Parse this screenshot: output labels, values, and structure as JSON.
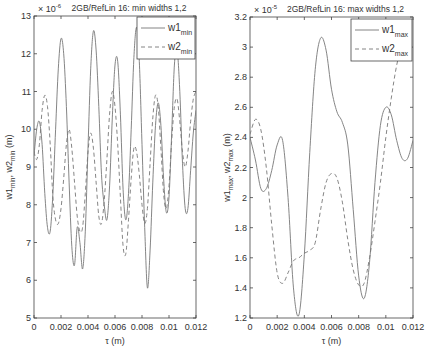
{
  "chart_data": [
    {
      "type": "line",
      "title": "2GB/RefLin 16: min widths 1,2",
      "scale_label": "× 10⁻⁶",
      "xlabel": "τ (m)",
      "ylabel": "w1_min, w2_min (m)",
      "xlim": [
        0,
        0.012
      ],
      "ylim": [
        5,
        13
      ],
      "xticks": [
        "0",
        "0.002",
        "0.004",
        "0.006",
        "0.008",
        "0.01",
        "0.012"
      ],
      "yticks": [
        "5",
        "6",
        "7",
        "8",
        "9",
        "10",
        "11",
        "12",
        "13"
      ],
      "grid": false,
      "legend_position": "top-right",
      "series": [
        {
          "name": "w1_min",
          "style": "solid",
          "x": [
            0,
            0.0002,
            0.0004,
            0.0006,
            0.0008,
            0.001,
            0.0012,
            0.0014,
            0.0016,
            0.0018,
            0.002,
            0.0022,
            0.0024,
            0.0026,
            0.0028,
            0.003,
            0.0032,
            0.0034,
            0.0036,
            0.0038,
            0.004,
            0.0042,
            0.0044,
            0.0046,
            0.0048,
            0.005,
            0.0052,
            0.0054,
            0.0056,
            0.0058,
            0.006,
            0.0062,
            0.0064,
            0.0066,
            0.0068,
            0.007,
            0.0072,
            0.0074,
            0.0076,
            0.0078,
            0.008,
            0.0082,
            0.0084,
            0.0086,
            0.0088,
            0.009,
            0.0092,
            0.0094,
            0.0096,
            0.0098,
            0.01,
            0.0102,
            0.0104,
            0.0106,
            0.0108,
            0.011,
            0.0112,
            0.0114,
            0.0116,
            0.0118,
            0.012
          ],
          "values": [
            9.3,
            10.0,
            10.2,
            9.6,
            8.3,
            7.4,
            7.3,
            8.3,
            10.0,
            11.6,
            12.4,
            12.0,
            10.6,
            8.6,
            6.9,
            6.4,
            7.4,
            7.0,
            6.3,
            7.3,
            9.5,
            11.6,
            12.6,
            12.1,
            10.6,
            8.8,
            8.0,
            7.6,
            8.5,
            10.3,
            11.7,
            11.8,
            10.4,
            8.4,
            7.6,
            8.3,
            10.0,
            11.9,
            12.7,
            11.8,
            9.6,
            7.4,
            5.8,
            6.8,
            8.6,
            10.1,
            10.7,
            10.1,
            8.7,
            7.8,
            8.2,
            9.9,
            11.7,
            12.1,
            11.0,
            9.1,
            7.9,
            7.9,
            8.9,
            9.9,
            10.5
          ]
        },
        {
          "name": "w2_min",
          "style": "dashed",
          "x": [
            0,
            0.0002,
            0.0004,
            0.0006,
            0.0008,
            0.001,
            0.0012,
            0.0014,
            0.0016,
            0.0018,
            0.002,
            0.0022,
            0.0024,
            0.0026,
            0.0028,
            0.003,
            0.0032,
            0.0034,
            0.0036,
            0.0038,
            0.004,
            0.0042,
            0.0044,
            0.0046,
            0.0048,
            0.005,
            0.0052,
            0.0054,
            0.0056,
            0.0058,
            0.006,
            0.0062,
            0.0064,
            0.0066,
            0.0068,
            0.007,
            0.0072,
            0.0074,
            0.0076,
            0.0078,
            0.008,
            0.0082,
            0.0084,
            0.0086,
            0.0088,
            0.009,
            0.0092,
            0.0094,
            0.0096,
            0.0098,
            0.01,
            0.0102,
            0.0104,
            0.0106,
            0.0108,
            0.011,
            0.0112,
            0.0114,
            0.0116,
            0.0118,
            0.012
          ],
          "values": [
            9.4,
            9.2,
            9.6,
            10.5,
            10.9,
            10.6,
            9.6,
            8.2,
            7.6,
            7.5,
            7.9,
            8.7,
            9.6,
            10.0,
            9.5,
            8.6,
            7.7,
            7.3,
            7.4,
            8.3,
            9.4,
            9.9,
            9.5,
            8.6,
            7.7,
            7.5,
            8.1,
            9.2,
            10.4,
            11.0,
            10.6,
            9.6,
            8.2,
            6.9,
            6.7,
            7.6,
            8.7,
            9.5,
            9.4,
            8.8,
            8.0,
            7.5,
            7.9,
            9.1,
            10.3,
            10.9,
            10.6,
            9.5,
            8.3,
            7.9,
            8.5,
            9.7,
            10.6,
            10.8,
            10.2,
            9.4,
            9.0,
            9.4,
            10.2,
            10.8,
            11.0
          ]
        }
      ]
    },
    {
      "type": "line",
      "title": "2GB/RefLin 16: max widths 1,2",
      "scale_label": "× 10⁻⁵",
      "xlabel": "τ (m)",
      "ylabel": "w1_max, w2_max (m)",
      "xlim": [
        0,
        0.012
      ],
      "ylim": [
        1.2,
        3.2
      ],
      "xticks": [
        "0",
        "0.002",
        "0.004",
        "0.006",
        "0.008",
        "0.01",
        "0.012"
      ],
      "yticks": [
        "1.2",
        "1.4",
        "1.6",
        "1.8",
        "2",
        "2.2",
        "2.4",
        "2.6",
        "2.8",
        "3",
        "3.2"
      ],
      "grid": false,
      "legend_position": "top-right",
      "series": [
        {
          "name": "w1_max",
          "style": "solid",
          "x": [
            0,
            0.0004,
            0.0008,
            0.0012,
            0.0016,
            0.002,
            0.0024,
            0.0028,
            0.0032,
            0.0036,
            0.004,
            0.0044,
            0.0048,
            0.0052,
            0.0056,
            0.006,
            0.0064,
            0.0068,
            0.0072,
            0.0076,
            0.008,
            0.0084,
            0.0088,
            0.0092,
            0.0096,
            0.01,
            0.0104,
            0.0108,
            0.0112,
            0.0116,
            0.012
          ],
          "values": [
            2.4,
            2.25,
            2.06,
            2.06,
            2.18,
            2.35,
            2.38,
            2.0,
            1.4,
            1.22,
            1.62,
            2.3,
            2.85,
            3.06,
            2.98,
            2.72,
            2.57,
            2.5,
            2.35,
            1.92,
            1.48,
            1.33,
            1.57,
            2.1,
            2.48,
            2.6,
            2.55,
            2.38,
            2.26,
            2.26,
            2.38
          ]
        },
        {
          "name": "w2_max",
          "style": "dashed",
          "x": [
            0,
            0.0004,
            0.0008,
            0.0012,
            0.0016,
            0.002,
            0.0024,
            0.0028,
            0.0032,
            0.0036,
            0.004,
            0.0044,
            0.0048,
            0.0052,
            0.0056,
            0.006,
            0.0064,
            0.0068,
            0.0072,
            0.0076,
            0.008,
            0.0084,
            0.0088,
            0.0092,
            0.0096,
            0.01,
            0.0104,
            0.0108,
            0.0112,
            0.0116,
            0.012
          ],
          "values": [
            2.42,
            2.52,
            2.45,
            2.2,
            1.82,
            1.5,
            1.43,
            1.5,
            1.58,
            1.6,
            1.63,
            1.65,
            1.7,
            1.92,
            2.1,
            2.16,
            2.13,
            1.97,
            1.72,
            1.52,
            1.42,
            1.43,
            1.6,
            1.84,
            2.1,
            2.4,
            2.66,
            2.88,
            3.02,
            3.14,
            3.2
          ]
        }
      ]
    }
  ],
  "left": {
    "title": "2GB/RefLin 16: min widths 1,2",
    "scale": "× 10",
    "scale_exp": "-6",
    "xlabel": "τ (m)",
    "ylabel_main": "w1",
    "legend": [
      {
        "main": "w1",
        "sub": "min"
      },
      {
        "main": "w2",
        "sub": "min"
      }
    ]
  },
  "right": {
    "title": "2GB/RefLin 16: max widths 1,2",
    "scale": "× 10",
    "scale_exp": "-5",
    "xlabel": "τ (m)",
    "legend": [
      {
        "main": "w1",
        "sub": "max"
      },
      {
        "main": "w2",
        "sub": "max"
      }
    ]
  }
}
